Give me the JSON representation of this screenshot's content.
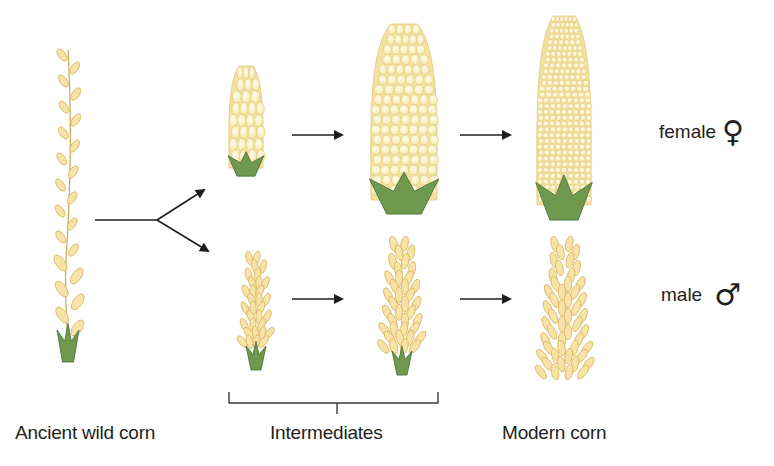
{
  "diagram": {
    "stages": [
      {
        "id": "ancient",
        "label": "Ancient wild corn"
      },
      {
        "id": "intermediates",
        "label": "Intermediates"
      },
      {
        "id": "modern",
        "label": "Modern corn"
      }
    ],
    "rows": [
      {
        "id": "female",
        "label": "female",
        "symbol": "♀"
      },
      {
        "id": "male",
        "label": "male",
        "symbol": "♂"
      }
    ],
    "colors": {
      "kernel_fill": "#fbf1c4",
      "kernel_stroke": "#e2c77a",
      "spikelet_fill": "#f7e3a8",
      "spikelet_stroke": "#d8b45c",
      "husk": "#6f9a4e",
      "husk_dark": "#3f6b33",
      "arrow": "#1e1e1e",
      "text": "#1e1e1e"
    }
  }
}
